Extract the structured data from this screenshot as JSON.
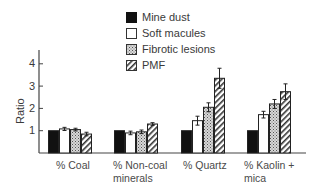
{
  "chart_data": {
    "type": "bar",
    "title": "",
    "xlabel": "",
    "ylabel": "Ratio",
    "ylim": [
      0,
      4
    ],
    "yticks": [
      1,
      2,
      3,
      4
    ],
    "grid": false,
    "legend_position": "top-right",
    "categories": [
      "% Coal",
      "% Non-coal minerals",
      "% Quartz",
      "% Kaolin + mica"
    ],
    "series": [
      {
        "name": "Mine dust",
        "pattern": "solid-black",
        "values": [
          1.0,
          1.0,
          1.0,
          1.0
        ],
        "errors": [
          0,
          0,
          0,
          0
        ]
      },
      {
        "name": "Soft macules",
        "pattern": "white",
        "values": [
          1.08,
          0.9,
          1.45,
          1.72
        ],
        "errors": [
          0.07,
          0.08,
          0.2,
          0.15
        ]
      },
      {
        "name": "Fibrotic lesions",
        "pattern": "dotted-gray",
        "values": [
          1.05,
          0.95,
          2.05,
          2.2
        ],
        "errors": [
          0.06,
          0.08,
          0.2,
          0.2
        ]
      },
      {
        "name": "PMF",
        "pattern": "diagonal-hatch",
        "values": [
          0.85,
          1.3,
          3.35,
          2.75
        ],
        "errors": [
          0.08,
          0.06,
          0.45,
          0.35
        ]
      }
    ]
  },
  "legend": {
    "items": [
      "Mine dust",
      "Soft macules",
      "Fibrotic lesions",
      "PMF"
    ]
  },
  "axis": {
    "ylabel": "Ratio",
    "ticks": [
      "1",
      "2",
      "3",
      "4"
    ]
  },
  "categories": {
    "c0": {
      "line1": "% Coal",
      "line2": ""
    },
    "c1": {
      "line1": "% Non-coal",
      "line2": "minerals"
    },
    "c2": {
      "line1": "% Quartz",
      "line2": ""
    },
    "c3": {
      "line1": "% Kaolin +",
      "line2": "mica"
    }
  }
}
